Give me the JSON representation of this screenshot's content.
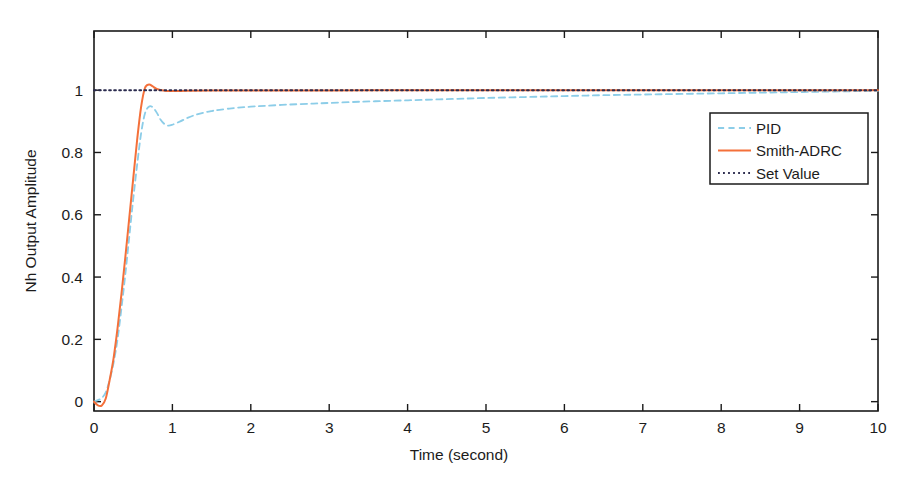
{
  "chart_data": {
    "type": "line",
    "title": "",
    "xlabel": "Time (second)",
    "ylabel": "Nh Output Amplitude",
    "xlim": [
      0,
      10
    ],
    "ylim": [
      -0.03,
      1.19
    ],
    "grid": false,
    "legend_position": "upper right",
    "xticks": [
      "0",
      "1",
      "2",
      "3",
      "4",
      "5",
      "6",
      "7",
      "8",
      "9",
      "10"
    ],
    "xtick_values": [
      0,
      1,
      2,
      3,
      4,
      5,
      6,
      7,
      8,
      9,
      10
    ],
    "yticks": [
      "0",
      "0.2",
      "0.4",
      "0.6",
      "0.8",
      "1"
    ],
    "ytick_values": [
      0,
      0.2,
      0.4,
      0.6,
      0.8,
      1
    ],
    "series": [
      {
        "name": "PID",
        "color": "#8CCDE8",
        "style": "dashed",
        "width": 1.8,
        "x": [
          0,
          0.05,
          0.1,
          0.15,
          0.2,
          0.25,
          0.3,
          0.35,
          0.4,
          0.45,
          0.5,
          0.55,
          0.6,
          0.65,
          0.7,
          0.75,
          0.8,
          0.85,
          0.9,
          0.95,
          1.0,
          1.1,
          1.2,
          1.3,
          1.4,
          1.5,
          1.6,
          1.8,
          2.0,
          2.2,
          2.5,
          2.8,
          3.0,
          3.4,
          3.8,
          4.2,
          4.6,
          5.0,
          5.5,
          6.0,
          6.5,
          7.0,
          7.5,
          8.0,
          8.5,
          9.0,
          9.5,
          10.0
        ],
        "y": [
          0,
          0.005,
          0.012,
          0.03,
          0.07,
          0.125,
          0.2,
          0.3,
          0.41,
          0.53,
          0.65,
          0.76,
          0.86,
          0.925,
          0.947,
          0.945,
          0.928,
          0.905,
          0.891,
          0.886,
          0.889,
          0.9,
          0.912,
          0.921,
          0.928,
          0.933,
          0.937,
          0.943,
          0.947,
          0.95,
          0.954,
          0.957,
          0.959,
          0.963,
          0.966,
          0.969,
          0.972,
          0.975,
          0.978,
          0.981,
          0.984,
          0.986,
          0.988,
          0.99,
          0.992,
          0.994,
          0.996,
          0.998
        ]
      },
      {
        "name": "Smith-ADRC",
        "color": "#F4703A",
        "style": "solid",
        "width": 2.0,
        "x": [
          0,
          0.05,
          0.1,
          0.15,
          0.2,
          0.25,
          0.3,
          0.35,
          0.4,
          0.45,
          0.5,
          0.55,
          0.6,
          0.65,
          0.7,
          0.75,
          0.8,
          0.9,
          1.0,
          1.2,
          1.5,
          2.0,
          2.5,
          3.0,
          4.0,
          5.0,
          6.0,
          7.0,
          8.0,
          9.0,
          10.0
        ],
        "y": [
          0,
          -0.012,
          -0.012,
          0.01,
          0.07,
          0.14,
          0.235,
          0.345,
          0.465,
          0.59,
          0.715,
          0.84,
          0.945,
          1.007,
          1.018,
          1.012,
          1.004,
          0.998,
          0.997,
          0.998,
          0.999,
          0.999,
          0.999,
          0.999,
          1.0,
          1.0,
          1.0,
          1.0,
          1.0,
          1.0,
          1.0
        ]
      },
      {
        "name": "Set Value",
        "color": "#2b2b4e",
        "style": "dotted",
        "width": 1.9,
        "x": [
          0,
          10
        ],
        "y": [
          1,
          1
        ]
      }
    ]
  },
  "legend": {
    "entries": [
      {
        "label": "PID"
      },
      {
        "label": "Smith-ADRC"
      },
      {
        "label": "Set Value"
      }
    ]
  },
  "axes": {
    "x_title": "Time (second)",
    "y_title": "Nh Output Amplitude"
  }
}
